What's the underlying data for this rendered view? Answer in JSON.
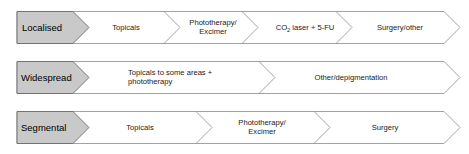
{
  "diagram": {
    "colors": {
      "label_fill": "#c9c9c9",
      "label_stroke": "#6b6b6b",
      "step_fill": "#ffffff",
      "step_stroke": "#8a8a8a",
      "text": "#1a1a1a"
    },
    "rows": [
      {
        "id": "localised",
        "label": "Localised",
        "steps": [
          {
            "id": "topicals",
            "lines": [
              "Topicals"
            ]
          },
          {
            "id": "phototherapy-excimer",
            "lines": [
              "Phototherapy/",
              "Excimer"
            ]
          },
          {
            "id": "co2-laser-5fu",
            "lines": [
              "CO2 laser + 5-FU"
            ],
            "rich": {
              "pre": "CO",
              "sub": "2",
              "post": " laser + 5-FU"
            }
          },
          {
            "id": "surgery-other",
            "lines": [
              "Surgery/other"
            ]
          }
        ]
      },
      {
        "id": "widespread",
        "label": "Widespread",
        "steps": [
          {
            "id": "topicals-some-areas-phototherapy",
            "lines": [
              "Topicals to some areas +",
              "phototherapy"
            ]
          },
          {
            "id": "other-depigmentation",
            "lines": [
              "Other/depigmentation"
            ]
          }
        ]
      },
      {
        "id": "segmental",
        "label": "Segmental",
        "steps": [
          {
            "id": "topicals",
            "lines": [
              "Topicals"
            ]
          },
          {
            "id": "phototherapy-excimer",
            "lines": [
              "Phototherapy/",
              "Excimer"
            ]
          },
          {
            "id": "surgery",
            "lines": [
              "Surgery"
            ]
          }
        ]
      }
    ]
  }
}
